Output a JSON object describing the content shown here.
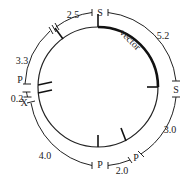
{
  "diagram": {
    "type": "plasmid map",
    "inner_ring": {
      "label": "vector",
      "color": "#111111"
    },
    "outer_ring": {
      "site_labels": [
        "S",
        "S",
        "P",
        "P",
        "X",
        "P"
      ],
      "segments": [
        {
          "label": "2.5"
        },
        {
          "label": "5.2"
        },
        {
          "label": "3.0"
        },
        {
          "label": "2.0"
        },
        {
          "label": "4.0"
        },
        {
          "label": "0.2"
        },
        {
          "label": "3.3"
        }
      ]
    },
    "labels": {
      "s_top": "S",
      "s_right": "S",
      "p_lower_right": "P",
      "p_bottom": "P",
      "x_left": "X",
      "p_left": "P",
      "seg_2_5": "2.5",
      "seg_5_2": "5.2",
      "seg_3_0": "3.0",
      "seg_2_0": "2.0",
      "seg_4_0": "4.0",
      "seg_0_2": "0.2",
      "seg_3_3": "3.3",
      "vector": "vector"
    }
  }
}
